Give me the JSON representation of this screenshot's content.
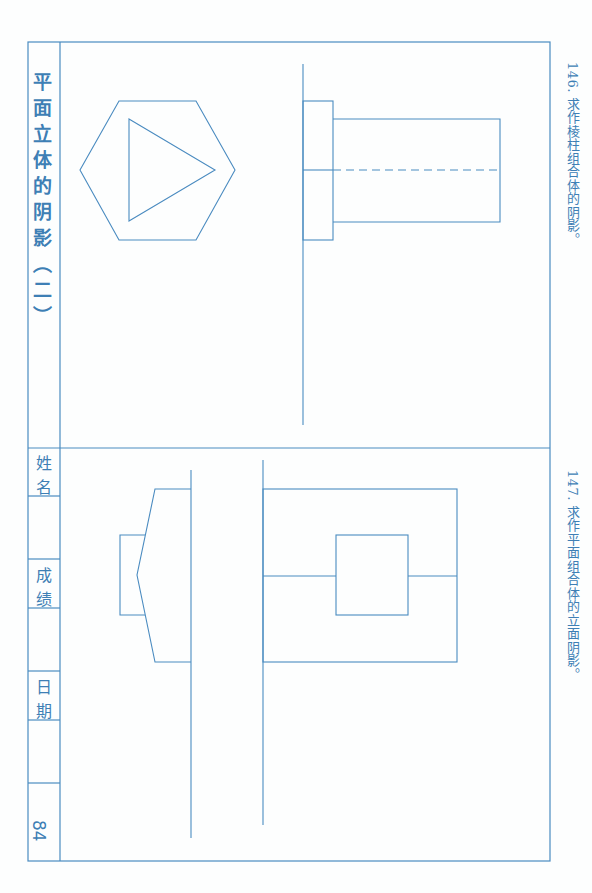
{
  "page": {
    "title": "平面立体的阴影（二）",
    "page_number": "84",
    "accent_color": "#3e7fb5",
    "line_color": "#5b95c4"
  },
  "problems": [
    {
      "number": "146.",
      "text": "146. 求作棱柱组合体的阴影。"
    },
    {
      "number": "147.",
      "text": "147. 求作平面组合体的立面阴影。"
    }
  ],
  "fields": {
    "name_label": "姓名",
    "grade_label": "成绩",
    "date_label": "日期"
  },
  "drawings": [
    {
      "id": "146-elevation",
      "description": "T-shaped elevation: flange rectangle with long prism rectangle and dashed center line"
    },
    {
      "id": "146-plan",
      "description": "Hexagon containing triangle"
    },
    {
      "id": "147-elevation",
      "description": "Large rectangle with inner square and horizontal center line"
    },
    {
      "id": "147-plan",
      "description": "Trapezoidal pointed plan with small rectangle"
    }
  ]
}
